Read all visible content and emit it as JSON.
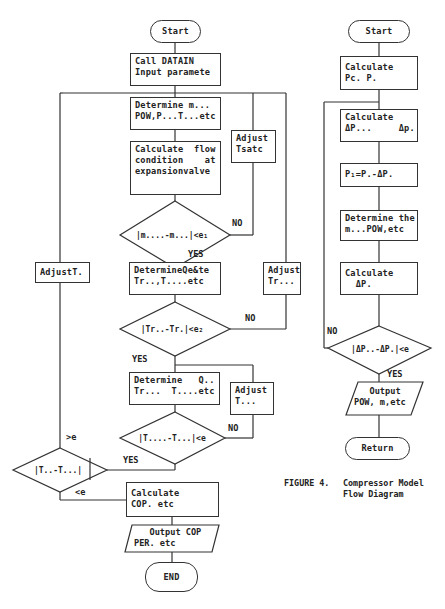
{
  "left_chart": {
    "start": "Start",
    "call_datain": "Call DATAIN\nInput paramete",
    "determine_m": "Determine m...\nPOW,P...T...etc",
    "calc_flow": "Calculate  flow\ncondition    at\nexpansionvalve",
    "adjust_tsatc": "Adjust\nTsatc",
    "diamond1": "|m....-m...|<e₁",
    "diamond1_no": "NO",
    "diamond1_yes": "YES",
    "determine_qe": "DetermineQe&te\nTr..,T....etc",
    "adjust_tcond": "Adjust\nTr...",
    "diamond2": "|Tr..-Tr.|<e₂",
    "diamond2_no": "NO",
    "diamond2_yes": "YES",
    "adjust_t_left": "AdjustT.",
    "determine_q": "Determine   Q..\nTr...  T....etc",
    "adjust_t3": "Adjust\nT...",
    "diamond3": "|T....-T...|<e",
    "diamond3_no": "NO",
    "diamond3_yes": "YES",
    "diamond4": "|T..-T...|",
    "diamond4_gt": ">e",
    "diamond4_lt": "<e",
    "calc_cop": "Calculate\nCOP. etc",
    "output_cop": "   Output COP\nPER. etc",
    "end": "END"
  },
  "right_chart": {
    "start": "Start",
    "calc_pc": "Calculate\nPc. P.",
    "calc_dp": "Calculate\nΔP...     Δp.",
    "p1": "P₁=P.-ΔP.",
    "determine_the": "Determine the\nm...POW,etc",
    "calc_dps": "Calculate\n  ΔP.",
    "diamond": "|ΔP..-ΔP.|<e",
    "diamond_no": "NO",
    "diamond_yes": "YES",
    "output": "   Output\nPOW, m,etc",
    "return": "Return"
  },
  "caption": {
    "figure": "FIGURE 4.",
    "title": "Compressor Model\nFlow Diagram"
  }
}
